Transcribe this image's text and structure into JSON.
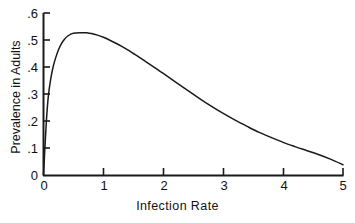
{
  "chart_data": {
    "type": "line",
    "title": "",
    "subtitle": "",
    "xlabel": "Infection Rate",
    "ylabel": "Prevalence in Adults",
    "xlim": [
      0,
      5
    ],
    "ylim": [
      0,
      0.6
    ],
    "grid": false,
    "legend": null,
    "xticks": [
      "0",
      "1",
      "2",
      "3",
      "4",
      "5"
    ],
    "xtick_values": [
      0,
      1,
      2,
      3,
      4,
      5
    ],
    "yticks": [
      "0",
      ".1",
      ".2",
      ".3",
      ".4",
      ".5",
      ".6"
    ],
    "ytick_values": [
      0,
      0.1,
      0.2,
      0.3,
      0.4,
      0.5,
      0.6
    ],
    "line_color": "#1a1a1a",
    "axis_color": "#1a1a1a",
    "series": [
      {
        "name": "Prevalence in Adults",
        "x": [
          0.0,
          0.02,
          0.05,
          0.08,
          0.12,
          0.16,
          0.2,
          0.25,
          0.3,
          0.35,
          0.4,
          0.45,
          0.5,
          0.6,
          0.7,
          0.72,
          0.8,
          0.9,
          1.0,
          1.1,
          1.2,
          1.3,
          1.4,
          1.5,
          1.6,
          1.7,
          1.8,
          1.9,
          2.0,
          2.2,
          2.4,
          2.6,
          2.8,
          3.0,
          3.2,
          3.4,
          3.6,
          3.8,
          4.0,
          4.2,
          4.4,
          4.6,
          4.8,
          5.0
        ],
        "y": [
          0.0,
          0.085,
          0.205,
          0.29,
          0.355,
          0.4,
          0.432,
          0.464,
          0.487,
          0.503,
          0.514,
          0.521,
          0.525,
          0.527,
          0.527,
          0.527,
          0.524,
          0.518,
          0.51,
          0.5,
          0.489,
          0.477,
          0.464,
          0.45,
          0.436,
          0.421,
          0.406,
          0.391,
          0.376,
          0.345,
          0.314,
          0.284,
          0.255,
          0.228,
          0.203,
          0.18,
          0.158,
          0.139,
          0.121,
          0.105,
          0.09,
          0.075,
          0.058,
          0.038
        ]
      }
    ]
  },
  "axes": {
    "x_title": "Infection Rate",
    "y_title": "Prevalence in Adults"
  }
}
